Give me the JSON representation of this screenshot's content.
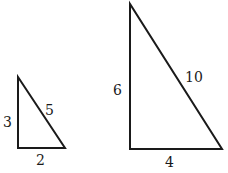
{
  "diagram": {
    "triangles": [
      {
        "name": "small-triangle",
        "sides": {
          "vertical": "3",
          "hypotenuse": "5",
          "base": "2"
        }
      },
      {
        "name": "large-triangle",
        "sides": {
          "vertical": "6",
          "hypotenuse": "10",
          "base": "4"
        }
      }
    ],
    "colors": {
      "stroke": "#1a1a1a",
      "background": "#ffffff"
    }
  }
}
